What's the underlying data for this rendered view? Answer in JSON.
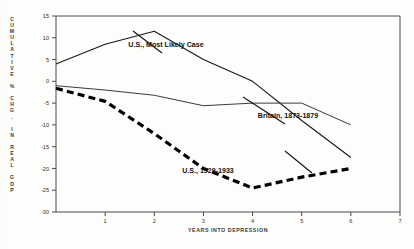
{
  "chart_data": {
    "type": "line",
    "title": "",
    "xlabel": "YEARS INTO DEPRESSION",
    "ylabel": "CUMULATIVE % CHG. IN REAL GDP",
    "ylabel_letters": [
      "C",
      "U",
      "M",
      "U",
      "L",
      "A",
      "T",
      "I",
      "V",
      "E",
      "",
      "%",
      "",
      "C",
      "H",
      "G",
      ".",
      "",
      "I",
      "N",
      "",
      "R",
      "E",
      "A",
      "L",
      "",
      "G",
      "D",
      "P"
    ],
    "xlim": [
      0,
      7
    ],
    "ylim": [
      -30,
      15
    ],
    "ytick_values": [
      15,
      10,
      5,
      0,
      -5,
      -10,
      -15,
      -20,
      -25,
      -30
    ],
    "ytick_labels": [
      "15",
      "10",
      "5",
      "0",
      "-5",
      "-10",
      "-15",
      "-20",
      "-25",
      "-30"
    ],
    "xtick_values": [
      1,
      2,
      3,
      4,
      5,
      6,
      7
    ],
    "xtick_labels": [
      "1",
      "2",
      "3",
      "4",
      "5",
      "6",
      "7"
    ],
    "grid": false,
    "legend_position": "inline-annotations",
    "x": [
      0,
      1,
      2,
      3,
      4,
      5,
      6
    ],
    "series": [
      {
        "name": "U.S., Most Likely Case",
        "style": "solid",
        "color": "#1a1a1a",
        "width": 1.15,
        "values": [
          4.0,
          8.5,
          11.5,
          5.0,
          0.0,
          -9.0,
          -17.5
        ]
      },
      {
        "name": "Britain, 1873-1879",
        "style": "solid",
        "color": "#3a3a3a",
        "width": 1.0,
        "values": [
          -1.0,
          -2.0,
          -3.2,
          -5.6,
          -5.0,
          -5.0,
          -10.0
        ]
      },
      {
        "name": "U.S., 1929-1933",
        "style": "dashed",
        "color": "#000000",
        "width": 3.2,
        "values": [
          -1.6,
          -4.6,
          -12.0,
          -20.0,
          -24.5,
          -22.0,
          -20.0
        ]
      }
    ],
    "annotations": [
      {
        "text": "U.S., Most Likely Case",
        "x_px": 166,
        "y_px": 47
      },
      {
        "text": "Britain, 1873-1879",
        "x_px": 288,
        "y_px": 118
      },
      {
        "text": "U.S., 1929-1933",
        "x_px": 208,
        "y_px": 173
      }
    ]
  }
}
